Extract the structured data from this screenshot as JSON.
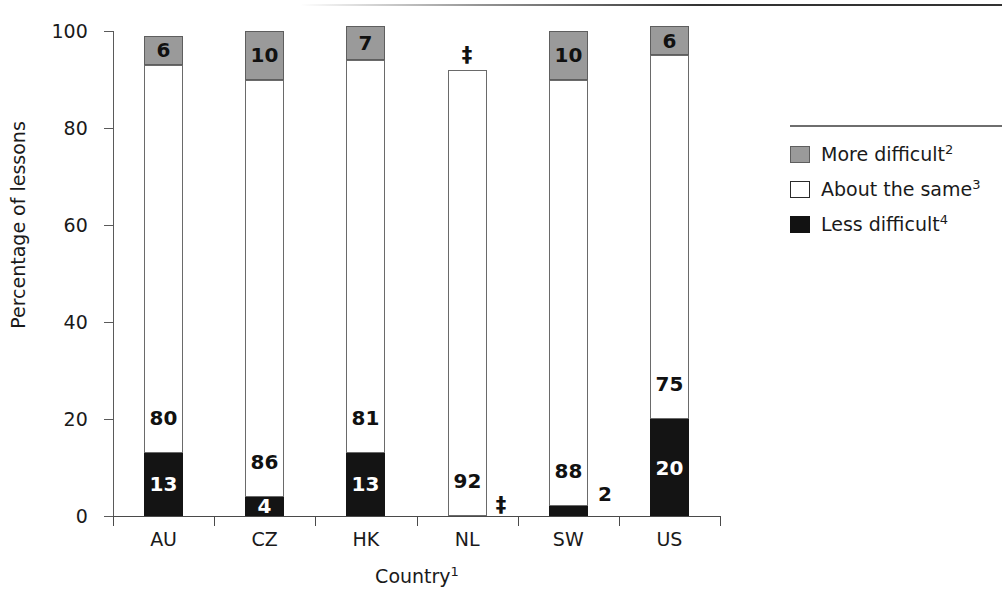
{
  "chart_data": {
    "type": "bar",
    "subtype": "stacked-bar-100",
    "title": "",
    "xlabel": "Country",
    "xlabel_superscript": "1",
    "ylabel": "Percentage of lessons",
    "ylim": [
      0,
      100
    ],
    "yticks": [
      0,
      20,
      40,
      60,
      80,
      100
    ],
    "ytick_labels": [
      "0",
      "20",
      "40",
      "60",
      "80",
      "100"
    ],
    "grid": false,
    "legend_position": "right",
    "suppression_symbol": "‡",
    "categories": [
      "AU",
      "CZ",
      "HK",
      "NL",
      "SW",
      "US"
    ],
    "series": [
      {
        "name": "More difficult",
        "superscript": "2",
        "color": "#9a9a9a",
        "values": [
          6,
          10,
          7,
          null,
          10,
          6
        ],
        "labels": [
          "6",
          "10",
          "7",
          "‡",
          "10",
          "6"
        ]
      },
      {
        "name": "About the same",
        "superscript": "3",
        "color": "#ffffff",
        "values": [
          80,
          86,
          81,
          92,
          88,
          75
        ],
        "labels": [
          "80",
          "86",
          "81",
          "92",
          "88",
          "75"
        ]
      },
      {
        "name": "Less difficult",
        "superscript": "4",
        "color": "#121212",
        "values": [
          13,
          4,
          13,
          null,
          2,
          20
        ],
        "labels": [
          "13",
          "4",
          "13",
          "‡",
          "2",
          "20"
        ]
      }
    ]
  },
  "axes": {
    "y_title": "Percentage of lessons",
    "x_title": "Country",
    "x_title_sup": "1",
    "y_ticks": [
      {
        "value": 100,
        "label": "100"
      },
      {
        "value": 80,
        "label": "80"
      },
      {
        "value": 60,
        "label": "60"
      },
      {
        "value": 40,
        "label": "40"
      },
      {
        "value": 20,
        "label": "20"
      },
      {
        "value": 0,
        "label": "0"
      }
    ],
    "x_categories": [
      "AU",
      "CZ",
      "HK",
      "NL",
      "SW",
      "US"
    ]
  },
  "bars": [
    {
      "category": "AU",
      "more": {
        "value": 6,
        "label": "6",
        "label_color": "dark",
        "inside": true
      },
      "same": {
        "value": 80,
        "label": "80",
        "label_color": "dark",
        "inside": true
      },
      "less": {
        "value": 13,
        "label": "13",
        "label_color": "light",
        "inside": true
      }
    },
    {
      "category": "CZ",
      "more": {
        "value": 10,
        "label": "10",
        "label_color": "dark",
        "inside": true
      },
      "same": {
        "value": 86,
        "label": "86",
        "label_color": "dark",
        "inside": true
      },
      "less": {
        "value": 4,
        "label": "4",
        "label_color": "light",
        "inside": true
      }
    },
    {
      "category": "HK",
      "more": {
        "value": 7,
        "label": "7",
        "label_color": "dark",
        "inside": true
      },
      "same": {
        "value": 81,
        "label": "81",
        "label_color": "dark",
        "inside": true
      },
      "less": {
        "value": 13,
        "label": "13",
        "label_color": "light",
        "inside": true
      }
    },
    {
      "category": "NL",
      "more": {
        "value": null,
        "label": "‡",
        "label_color": "dark",
        "inside": false
      },
      "same": {
        "value": 92,
        "label": "92",
        "label_color": "dark",
        "inside": true
      },
      "less": {
        "value": null,
        "label": "‡",
        "label_color": "dark",
        "inside": false
      }
    },
    {
      "category": "SW",
      "more": {
        "value": 10,
        "label": "10",
        "label_color": "dark",
        "inside": true
      },
      "same": {
        "value": 88,
        "label": "88",
        "label_color": "dark",
        "inside": true
      },
      "less": {
        "value": 2,
        "label": "2",
        "label_color": "dark",
        "inside": false
      }
    },
    {
      "category": "US",
      "more": {
        "value": 6,
        "label": "6",
        "label_color": "dark",
        "inside": true
      },
      "same": {
        "value": 75,
        "label": "75",
        "label_color": "dark",
        "inside": true
      },
      "less": {
        "value": 20,
        "label": "20",
        "label_color": "light",
        "inside": true
      }
    }
  ],
  "legend": {
    "items": [
      {
        "label": "More difficult",
        "sup": "2",
        "swatch": "more-difficult-swatch"
      },
      {
        "label": "About the same",
        "sup": "3",
        "swatch": "about-the-same-swatch"
      },
      {
        "label": "Less difficult",
        "sup": "4",
        "swatch": "less-difficult-swatch"
      }
    ]
  },
  "colors": {
    "more_difficult": "#9a9a9a",
    "about_the_same": "#ffffff",
    "less_difficult": "#121212",
    "axis": "#4a4a4a",
    "text": "#1a1a1a"
  }
}
